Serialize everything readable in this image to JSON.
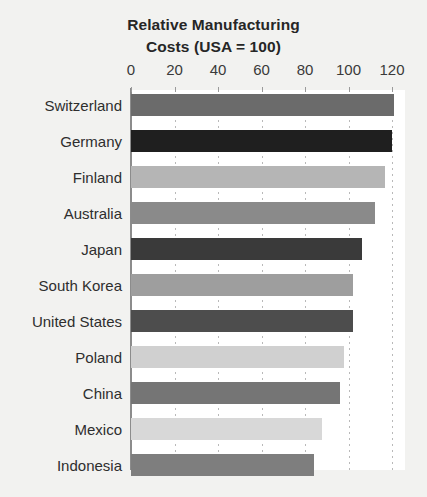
{
  "chart_data": {
    "type": "bar",
    "orientation": "horizontal",
    "title": "Relative Manufacturing Costs (USA = 100)",
    "title_lines": [
      "Relative Manufacturing",
      "Costs (USA = 100)"
    ],
    "xlabel": "",
    "ylabel": "",
    "xlim": [
      0,
      125
    ],
    "xticks": [
      0,
      20,
      40,
      60,
      80,
      100,
      120
    ],
    "xtick_labels": [
      "0",
      "20",
      "40",
      "60",
      "80",
      "100",
      "120"
    ],
    "grid": "vertical-dotted",
    "legend": "none",
    "categories": [
      "Switzerland",
      "Germany",
      "Finland",
      "Australia",
      "Japan",
      "South Korea",
      "United States",
      "Poland",
      "China",
      "Mexico",
      "Indonesia"
    ],
    "values": [
      121,
      120,
      117,
      112,
      106,
      102,
      102,
      98,
      96,
      88,
      84
    ],
    "bar_colors": [
      "#6b6b6b",
      "#1f1f1f",
      "#b5b5b5",
      "#8a8a8a",
      "#3a3a3a",
      "#9e9e9e",
      "#4d4d4d",
      "#d0d0d0",
      "#757575",
      "#d8d8d8",
      "#7e7e7e"
    ],
    "background_color": "#f2f2f0",
    "plot_background_color": "#ffffff",
    "axis_color": "#8c8c8c",
    "text_color": "#2e2e2e"
  }
}
